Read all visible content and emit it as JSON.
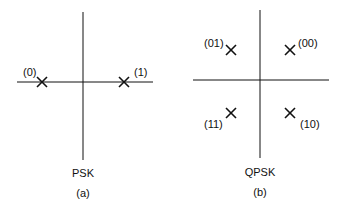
{
  "panels": [
    {
      "name": "PSK",
      "caption": "(a)",
      "points": [
        {
          "label": "(0)",
          "x": 42,
          "y": 82
        },
        {
          "label": "(1)",
          "x": 124,
          "y": 82
        }
      ]
    },
    {
      "name": "QPSK",
      "caption": "(b)",
      "points": [
        {
          "label": "(01)",
          "x": 231,
          "y": 50
        },
        {
          "label": "(00)",
          "x": 290,
          "y": 50
        },
        {
          "label": "(11)",
          "x": 231,
          "y": 113
        },
        {
          "label": "(10)",
          "x": 290,
          "y": 113
        }
      ]
    }
  ]
}
